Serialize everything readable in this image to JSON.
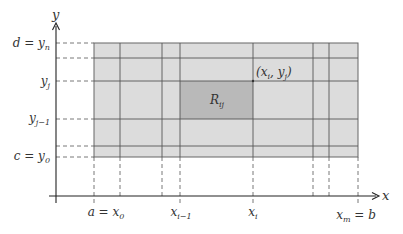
{
  "diagram": {
    "colors": {
      "region_fill": "#dcdcdc",
      "highlight_fill": "#b9b9b9",
      "grid_line": "#555555",
      "axis": "#222222",
      "dashed": "#555555"
    },
    "axes": {
      "x_label": "x",
      "y_label": "y"
    },
    "x_ticks": [
      {
        "id": "x0",
        "label_main": "a = x",
        "label_sub": "0"
      },
      {
        "id": "xi_minus_1",
        "label_main": "x",
        "label_sub": "i−1"
      },
      {
        "id": "xi",
        "label_main": "x",
        "label_sub": "i"
      },
      {
        "id": "xm",
        "label_main": "x",
        "label_sub": "m",
        "label_suffix": " = b"
      }
    ],
    "y_ticks": [
      {
        "id": "yn",
        "label_pre": "d = y",
        "label_sub": "n"
      },
      {
        "id": "yj",
        "label_pre": "y",
        "label_sub": "j"
      },
      {
        "id": "yj_minus_1",
        "label_pre": "y",
        "label_sub": "j−1"
      },
      {
        "id": "y0",
        "label_pre": "c = y",
        "label_sub": "0"
      }
    ],
    "cell_label": {
      "main": "R",
      "sub": "ij"
    },
    "point_label": {
      "open": "(x",
      "sub1": "i",
      "mid": ", y",
      "sub2": "j",
      "close": ")"
    }
  }
}
